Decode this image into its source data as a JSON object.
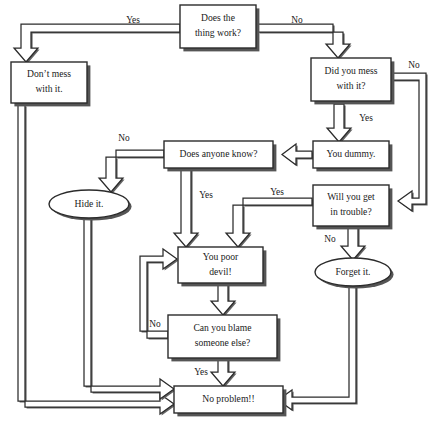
{
  "diagram": {
    "background_color": "#ffffff",
    "line_color": "#2b2b2b",
    "shadow_color": "#555555",
    "nodes": [
      {
        "id": "n1",
        "label_line1": "Does the",
        "label_line2": "thing work?",
        "shape": "box"
      },
      {
        "id": "n2",
        "label_line1": "Don’t mess",
        "label_line2": "with it.",
        "shape": "box"
      },
      {
        "id": "n3",
        "label_line1": "Did you mess",
        "label_line2": "with it?",
        "shape": "box"
      },
      {
        "id": "n4",
        "label_line1": "You dummy.",
        "label_line2": "",
        "shape": "box"
      },
      {
        "id": "n5",
        "label_line1": "Does anyone know?",
        "label_line2": "",
        "shape": "box"
      },
      {
        "id": "n6",
        "label_line1": "Will you get",
        "label_line2": "in trouble?",
        "shape": "box"
      },
      {
        "id": "n7",
        "label_line1": "Hide it.",
        "label_line2": "",
        "shape": "ellipse"
      },
      {
        "id": "n8",
        "label_line1": "Forget it.",
        "label_line2": "",
        "shape": "ellipse"
      },
      {
        "id": "n9",
        "label_line1": "You poor",
        "label_line2": "devil!",
        "shape": "box"
      },
      {
        "id": "n10",
        "label_line1": "Can you blame",
        "label_line2": "someone else?",
        "shape": "box"
      },
      {
        "id": "n11",
        "label_line1": "No problem!!",
        "label_line2": "",
        "shape": "box"
      }
    ],
    "edge_labels": {
      "yes_work": "Yes",
      "no_work": "No",
      "no_mess": "No",
      "yes_mess": "Yes",
      "no_anyone_know": "No",
      "yes_anyone_know": "Yes",
      "yes_trouble": "Yes",
      "no_trouble": "No",
      "no_blame": "No",
      "yes_blame": "Yes"
    }
  }
}
